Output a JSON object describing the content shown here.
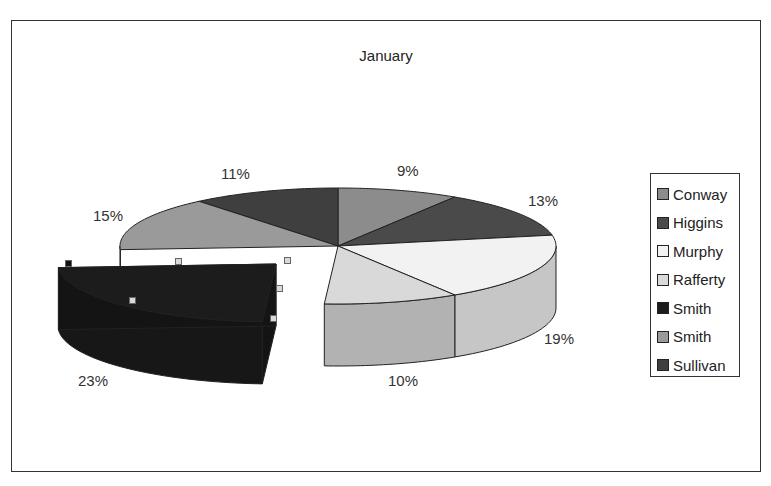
{
  "chart_data": {
    "type": "pie",
    "subtype": "3d-pie-exploded",
    "title": "January",
    "categories": [
      "Conway",
      "Higgins",
      "Murphy",
      "Rafferty",
      "Smith",
      "Smith",
      "Sullivan"
    ],
    "values": [
      9,
      13,
      19,
      10,
      23,
      15,
      11
    ],
    "labels": [
      "9%",
      "13%",
      "19%",
      "10%",
      "23%",
      "15%",
      "11%"
    ],
    "colors": [
      "#8c8c8c",
      "#4a4a4a",
      "#f2f2f2",
      "#d9d9d9",
      "#1c1c1c",
      "#9a9a9a",
      "#3f3f3f"
    ],
    "legend_position": "right",
    "exploded_slice_index": 4,
    "selected_slice_index": 4
  },
  "legend": {
    "items": [
      {
        "label": "Conway",
        "color": "#8c8c8c"
      },
      {
        "label": "Higgins",
        "color": "#4a4a4a"
      },
      {
        "label": "Murphy",
        "color": "#f2f2f2"
      },
      {
        "label": "Rafferty",
        "color": "#d9d9d9"
      },
      {
        "label": "Smith",
        "color": "#1c1c1c"
      },
      {
        "label": "Smith",
        "color": "#9a9a9a"
      },
      {
        "label": "Sullivan",
        "color": "#3f3f3f"
      }
    ]
  },
  "labels_pos": [
    {
      "text": "9%",
      "x": 397,
      "y": 162
    },
    {
      "text": "13%",
      "x": 528,
      "y": 192
    },
    {
      "text": "19%",
      "x": 544,
      "y": 330
    },
    {
      "text": "10%",
      "x": 388,
      "y": 372
    },
    {
      "text": "23%",
      "x": 78,
      "y": 372
    },
    {
      "text": "15%",
      "x": 93,
      "y": 207
    },
    {
      "text": "11%",
      "x": 221,
      "y": 165
    }
  ]
}
